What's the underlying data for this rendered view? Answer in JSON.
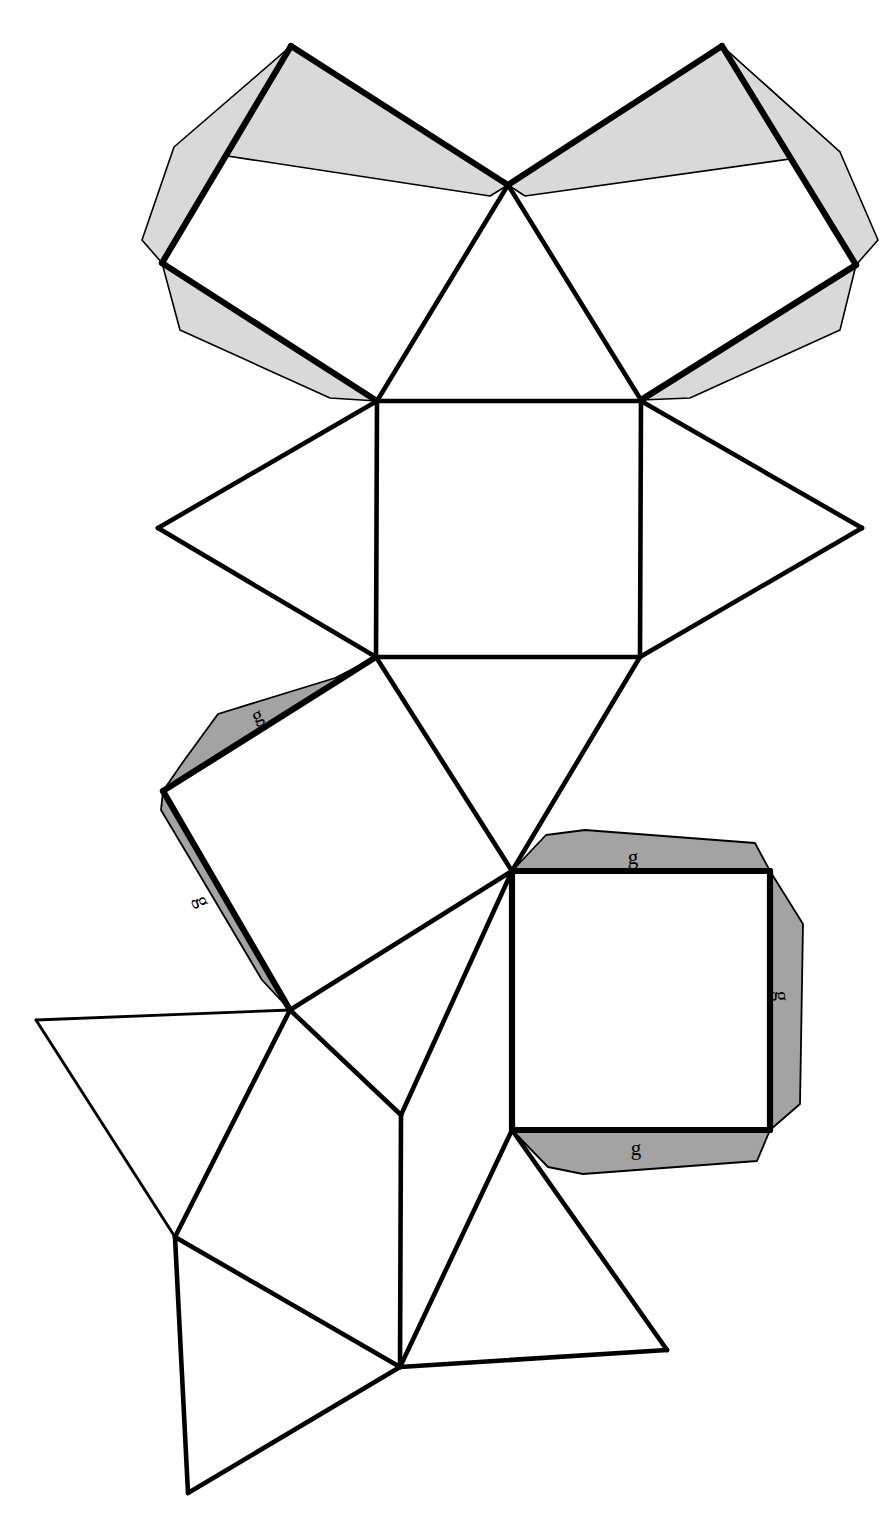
{
  "figure": {
    "kind": "polyhedron-net",
    "title": "",
    "background_color": "#ffffff",
    "line_color": "#000000",
    "tab_fill_light": "#d9d9d9",
    "tab_fill_dark": "#a3a3a3",
    "canvas": {
      "width": 893,
      "height": 1539
    }
  },
  "labels": {
    "glue_tab": "g"
  },
  "tab_labels": [
    {
      "id": "tab-label-upper-left-square-top",
      "text": "g",
      "x": 257,
      "y": 715,
      "rotation": -22
    },
    {
      "id": "tab-label-upper-left-square-left",
      "text": "g",
      "x": 203,
      "y": 901,
      "rotation": 70
    },
    {
      "id": "tab-label-right-square-top",
      "text": "g",
      "x": 633,
      "y": 857,
      "rotation": 0
    },
    {
      "id": "tab-label-right-square-right",
      "text": "g",
      "x": 782,
      "y": 996,
      "rotation": 90
    },
    {
      "id": "tab-label-right-square-bottom",
      "text": "g",
      "x": 636,
      "y": 1148,
      "rotation": 0
    }
  ],
  "faces": [
    {
      "id": "face-top-left-square",
      "shape": "square",
      "points": "291,46 508,185 377,401 162,263"
    },
    {
      "id": "face-top-right-square",
      "shape": "square",
      "points": "508,185 722,46 856,265 641,400"
    },
    {
      "id": "face-top-center-triangle",
      "shape": "triangle",
      "points": "508,185 641,400 377,401"
    },
    {
      "id": "face-center-square",
      "shape": "square",
      "points": "377,401 641,401 640,657 376,657"
    },
    {
      "id": "face-left-triangle",
      "shape": "triangle",
      "points": "377,401 376,657 158,528"
    },
    {
      "id": "face-right-triangle",
      "shape": "triangle",
      "points": "641,401 862,528 640,657"
    },
    {
      "id": "face-lower-center-triangle",
      "shape": "triangle",
      "points": "376,657 640,657 512,871"
    },
    {
      "id": "face-mid-left-square",
      "shape": "square",
      "points": "376,657 512,871 290,1010 163,791"
    },
    {
      "id": "face-mid-left-inner-triangle",
      "shape": "triangle",
      "points": "290,1010 512,871 401,1115"
    },
    {
      "id": "face-right-lower-square",
      "shape": "square",
      "points": "512,871 770,871 770,1130 512,1130"
    },
    {
      "id": "face-far-left-triangle",
      "shape": "triangle",
      "points": "290,1010 36,1020 175,1237"
    },
    {
      "id": "face-lower-left-square",
      "shape": "square",
      "points": "290,1010 401,1115 400,1367 175,1237"
    },
    {
      "id": "face-bottom-triangle",
      "shape": "triangle",
      "points": "175,1237 400,1367 188,1493"
    },
    {
      "id": "face-bottom-right-triangle",
      "shape": "triangle",
      "points": "512,1130 667,1350 400,1367"
    }
  ],
  "tabs_light": [
    {
      "id": "tab-top-left-square-upper",
      "points": "291,46 508,185 490,196 175,148"
    },
    {
      "id": "tab-top-left-square-left",
      "points": "291,46 162,263 142,240 174,147"
    },
    {
      "id": "tab-top-left-square-lower",
      "points": "162,263 377,401 330,398 180,330"
    },
    {
      "id": "tab-top-right-square-upper",
      "points": "722,46 508,185 525,196 840,152"
    },
    {
      "id": "tab-top-right-square-right",
      "points": "722,46 856,265 878,240 840,152"
    },
    {
      "id": "tab-top-right-square-lower",
      "points": "856,265 641,400 690,398 840,330"
    }
  ],
  "tabs_dark": [
    {
      "id": "tab-mid-left-square-top",
      "points": "376,657 163,791 183,762 218,714 335,678"
    },
    {
      "id": "tab-mid-left-square-left",
      "points": "163,791 290,1010 262,980 195,867 161,810"
    },
    {
      "id": "tab-right-square-top",
      "points": "512,871 770,871 755,843 585,830 546,835"
    },
    {
      "id": "tab-right-square-right",
      "points": "770,871 770,1130 800,1104 803,924"
    },
    {
      "id": "tab-right-square-bottom",
      "points": "512,1130 770,1130 757,1161 583,1174 548,1167"
    }
  ],
  "edges_heavy": [
    {
      "id": "edge-tl-square-top-right",
      "points": "291,46 508,185"
    },
    {
      "id": "edge-tl-square-top-left",
      "points": "291,46 162,263"
    },
    {
      "id": "edge-tl-square-bottom-left",
      "points": "162,263 377,401"
    },
    {
      "id": "edge-tr-square-top-left",
      "points": "722,46 508,185"
    },
    {
      "id": "edge-tr-square-top-right",
      "points": "722,46 856,265"
    },
    {
      "id": "edge-tr-square-bottom-right",
      "points": "856,265 641,400"
    },
    {
      "id": "edge-ml-square-top",
      "points": "376,657 163,791"
    },
    {
      "id": "edge-ml-square-left",
      "points": "163,791 290,1010"
    },
    {
      "id": "edge-rs-square-top",
      "points": "512,871 770,871"
    },
    {
      "id": "edge-rs-square-right",
      "points": "770,871 770,1130"
    },
    {
      "id": "edge-rs-square-bottom",
      "points": "512,1130 770,1130"
    },
    {
      "id": "edge-rs-square-left",
      "points": "512,871 512,1130"
    }
  ],
  "edges_med": [
    {
      "id": "edge-tl-bottom-right",
      "points": "508,185 377,401"
    },
    {
      "id": "edge-tr-bottom-left",
      "points": "508,185 641,400"
    },
    {
      "id": "edge-center-square-top",
      "points": "377,401 641,401"
    },
    {
      "id": "edge-center-square-left",
      "points": "377,401 376,657"
    },
    {
      "id": "edge-center-square-right",
      "points": "641,401 640,657"
    },
    {
      "id": "edge-center-square-bottom",
      "points": "376,657 640,657"
    },
    {
      "id": "edge-left-tri-upper",
      "points": "377,401 158,528"
    },
    {
      "id": "edge-left-tri-lower",
      "points": "158,528 376,657"
    },
    {
      "id": "edge-right-tri-upper",
      "points": "641,401 862,528"
    },
    {
      "id": "edge-right-tri-lower",
      "points": "862,528 640,657"
    },
    {
      "id": "edge-ml-square-right",
      "points": "376,657 512,871"
    },
    {
      "id": "edge-ml-square-bottom",
      "points": "290,1010 512,871"
    },
    {
      "id": "edge-lower-center-tri-left",
      "points": "640,657 512,871"
    },
    {
      "id": "edge-ml-inner-tri-right",
      "points": "512,871 401,1115"
    },
    {
      "id": "edge-ml-inner-tri-left",
      "points": "290,1010 401,1115"
    },
    {
      "id": "edge-lls-square-left",
      "points": "290,1010 175,1237"
    },
    {
      "id": "edge-lls-square-bottom",
      "points": "401,1115 400,1367"
    },
    {
      "id": "edge-lls-square-diag",
      "points": "175,1237 400,1367"
    },
    {
      "id": "edge-bottom-tri-left",
      "points": "175,1237 188,1493"
    },
    {
      "id": "edge-bottom-tri-right",
      "points": "188,1493 400,1367"
    },
    {
      "id": "edge-br-tri-left",
      "points": "512,1130 400,1367"
    },
    {
      "id": "edge-br-tri-right",
      "points": "512,1130 667,1350"
    },
    {
      "id": "edge-br-tri-bottom",
      "points": "400,1367 667,1350"
    }
  ],
  "edges_thin": [
    {
      "id": "edge-far-left-tri-top",
      "points": "290,1010 36,1020"
    },
    {
      "id": "edge-far-left-tri-left",
      "points": "36,1020 175,1237"
    }
  ]
}
